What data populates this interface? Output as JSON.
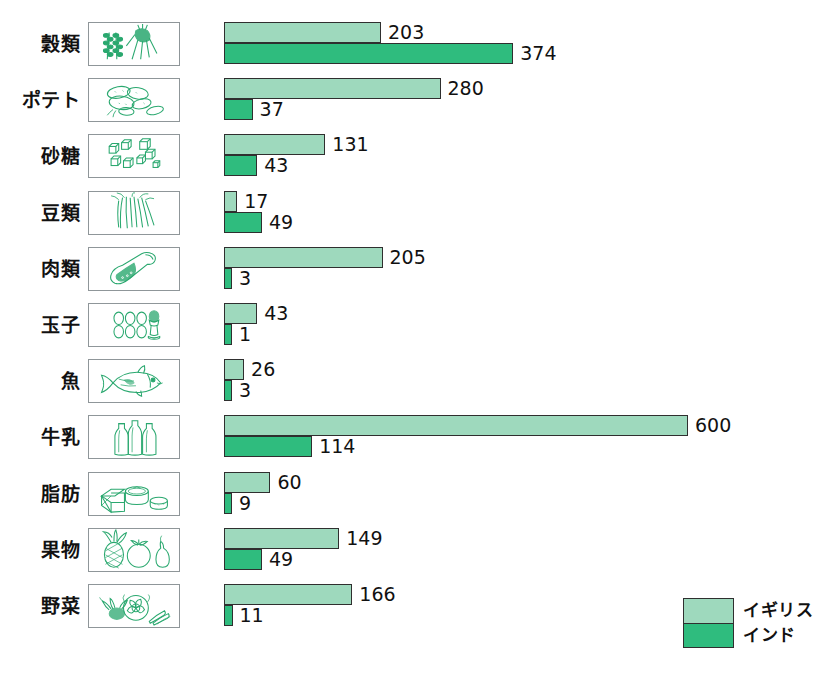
{
  "chart_data": {
    "type": "bar",
    "orientation": "horizontal",
    "title": "",
    "xlabel": "",
    "ylabel": "",
    "grid": false,
    "xlim": [
      0,
      600
    ],
    "legend_position": "bottom-right",
    "categories": [
      "穀類",
      "ポテト",
      "砂糖",
      "豆類",
      "肉類",
      "玉子",
      "魚",
      "牛乳",
      "脂肪",
      "果物",
      "野菜"
    ],
    "series": [
      {
        "name": "イギリス",
        "color": "#9ed9bd",
        "values": [
          203,
          280,
          131,
          17,
          205,
          43,
          26,
          600,
          60,
          149,
          166
        ]
      },
      {
        "name": "インド",
        "color": "#2fbc7e",
        "values": [
          374,
          37,
          43,
          49,
          3,
          1,
          3,
          114,
          9,
          49,
          11
        ]
      }
    ]
  },
  "rows": [
    {
      "label": "穀類",
      "icon": "grain-icon",
      "uk": 203,
      "india": 374
    },
    {
      "label": "ポテト",
      "icon": "potato-icon",
      "uk": 280,
      "india": 37
    },
    {
      "label": "砂糖",
      "icon": "sugar-icon",
      "uk": 131,
      "india": 43
    },
    {
      "label": "豆類",
      "icon": "beans-icon",
      "uk": 17,
      "india": 49
    },
    {
      "label": "肉類",
      "icon": "meat-icon",
      "uk": 205,
      "india": 3
    },
    {
      "label": "玉子",
      "icon": "eggs-icon",
      "uk": 43,
      "india": 1
    },
    {
      "label": "魚",
      "icon": "fish-icon",
      "uk": 26,
      "india": 3
    },
    {
      "label": "牛乳",
      "icon": "milk-icon",
      "uk": 600,
      "india": 114
    },
    {
      "label": "脂肪",
      "icon": "fat-icon",
      "uk": 60,
      "india": 9
    },
    {
      "label": "果物",
      "icon": "fruit-icon",
      "uk": 149,
      "india": 49
    },
    {
      "label": "野菜",
      "icon": "vegetable-icon",
      "uk": 166,
      "india": 11
    }
  ],
  "legend": {
    "uk_label": "イギリス",
    "india_label": "インド"
  },
  "colors": {
    "uk": "#9ed9bd",
    "india": "#2fbc7e",
    "outline": "#2f2f2f",
    "icon_stroke": "#2aa86f",
    "background": "#ffffff"
  }
}
